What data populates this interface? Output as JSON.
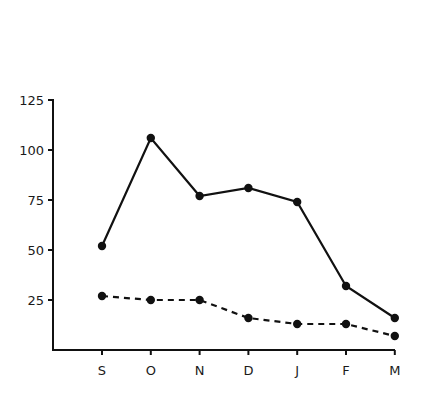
{
  "chart_data": {
    "type": "line",
    "title": "",
    "xlabel": "",
    "ylabel": "",
    "categories": [
      "S",
      "O",
      "N",
      "D",
      "J",
      "F",
      "M"
    ],
    "series": [
      {
        "name": "solid",
        "line_style": "solid",
        "values": [
          52,
          106,
          77,
          81,
          74,
          32,
          16
        ]
      },
      {
        "name": "dashed",
        "line_style": "dashed",
        "values": [
          27,
          25,
          25,
          16,
          13,
          13,
          7
        ]
      }
    ],
    "yticks": [
      25,
      50,
      75,
      100,
      125
    ],
    "ytick_labels": [
      "25",
      "50",
      "75",
      "100",
      "125"
    ],
    "ylim": [
      0,
      125
    ],
    "grid": false,
    "legend": "none",
    "colors": {
      "line": "#111111",
      "background": "#ffffff"
    }
  }
}
